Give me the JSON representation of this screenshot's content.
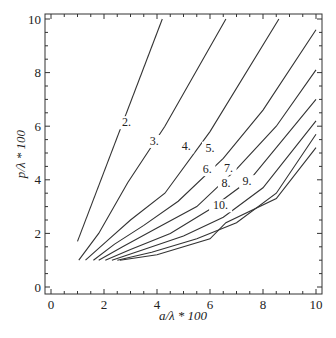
{
  "chart_data": {
    "type": "line",
    "title": "",
    "xlabel": "a/λ * 100",
    "ylabel": "p/λ * 100",
    "xlim": [
      0,
      10
    ],
    "ylim": [
      0,
      10
    ],
    "x_ticks": [
      "0",
      "2",
      "4",
      "6",
      "8",
      "10"
    ],
    "y_ticks": [
      "0",
      "2",
      "4",
      "6",
      "8",
      "10"
    ],
    "grid": false,
    "legend": "none (contour labels inline)",
    "series": [
      {
        "name": "2.",
        "label_pos": [
          2.85,
          6.0
        ],
        "points": [
          [
            1.0,
            1.7
          ],
          [
            4.2,
            10.0
          ]
        ]
      },
      {
        "name": "3.",
        "label_pos": [
          3.9,
          5.3
        ],
        "points": [
          [
            1.05,
            1.0
          ],
          [
            1.8,
            2.0
          ],
          [
            2.9,
            3.9
          ],
          [
            4.3,
            6.0
          ],
          [
            6.6,
            10.0
          ]
        ]
      },
      {
        "name": "4.",
        "label_pos": [
          5.1,
          5.1
        ],
        "points": [
          [
            1.3,
            1.0
          ],
          [
            2.2,
            1.8
          ],
          [
            3.0,
            2.5
          ],
          [
            4.3,
            3.5
          ],
          [
            6.0,
            5.8
          ],
          [
            8.6,
            10.0
          ]
        ]
      },
      {
        "name": "5.",
        "label_pos": [
          6.0,
          5.05
        ],
        "points": [
          [
            1.6,
            1.0
          ],
          [
            2.4,
            1.6
          ],
          [
            3.5,
            2.3
          ],
          [
            4.8,
            3.2
          ],
          [
            6.5,
            4.8
          ],
          [
            8.0,
            6.6
          ],
          [
            10.0,
            9.6
          ]
        ]
      },
      {
        "name": "6.",
        "label_pos": [
          5.9,
          4.25
        ],
        "points": [
          [
            1.8,
            1.0
          ],
          [
            2.7,
            1.5
          ],
          [
            4.0,
            2.2
          ],
          [
            5.5,
            3.0
          ],
          [
            7.0,
            4.4
          ],
          [
            8.5,
            6.0
          ],
          [
            10.0,
            8.1
          ]
        ]
      },
      {
        "name": "7.",
        "label_pos": [
          6.7,
          4.3
        ],
        "points": [
          [
            2.05,
            1.0
          ],
          [
            3.0,
            1.4
          ],
          [
            4.5,
            2.0
          ],
          [
            6.0,
            2.9
          ],
          [
            7.5,
            4.0
          ],
          [
            10.0,
            7.0
          ]
        ]
      },
      {
        "name": "8.",
        "label_pos": [
          6.6,
          3.75
        ],
        "points": [
          [
            2.3,
            1.0
          ],
          [
            3.5,
            1.4
          ],
          [
            5.0,
            1.9
          ],
          [
            6.5,
            2.6
          ],
          [
            8.0,
            3.7
          ],
          [
            10.0,
            6.2
          ]
        ]
      },
      {
        "name": "9.",
        "label_pos": [
          7.4,
          3.8
        ],
        "points": [
          [
            2.5,
            1.0
          ],
          [
            3.8,
            1.3
          ],
          [
            5.5,
            1.8
          ],
          [
            7.0,
            2.4
          ],
          [
            8.5,
            3.5
          ],
          [
            10.0,
            5.7
          ]
        ]
      },
      {
        "name": "10.",
        "label_pos": [
          6.4,
          2.9
        ],
        "points": [
          [
            2.6,
            1.0
          ],
          [
            4.0,
            1.2
          ],
          [
            6.0,
            1.8
          ],
          [
            6.6,
            2.4
          ],
          [
            8.5,
            3.3
          ],
          [
            10.0,
            5.2
          ]
        ]
      }
    ]
  },
  "colors": {
    "line": "#333333",
    "axis": "#333333",
    "background": "#ffffff"
  }
}
